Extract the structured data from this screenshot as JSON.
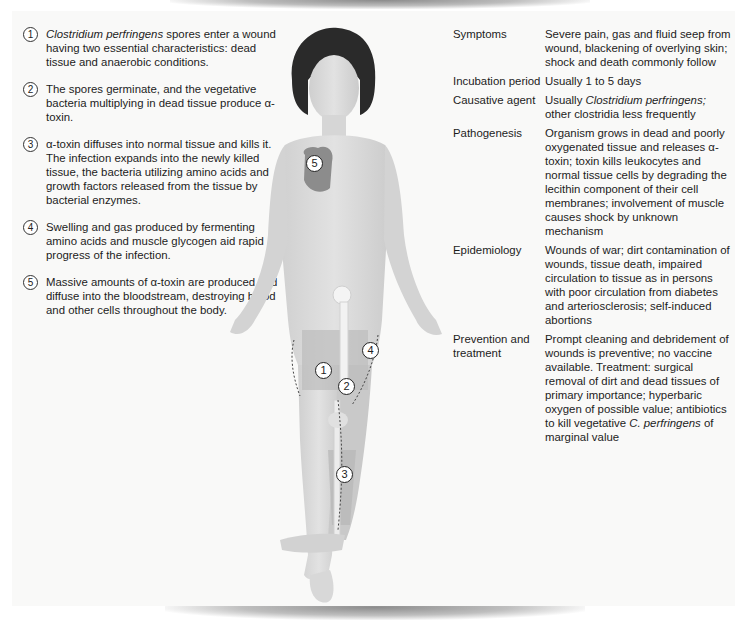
{
  "steps": [
    {
      "num": "1",
      "italic": "Clostridium perfringens",
      "text": " spores enter a wound having two essential characteristics: dead tissue and anaerobic conditions."
    },
    {
      "num": "2",
      "text": "The spores germinate, and the vegetative bacteria multiplying in dead tissue produce α-toxin."
    },
    {
      "num": "3",
      "text": "α-toxin diffuses into normal tissue and kills it. The infection expands into the newly killed tissue, the bacteria utilizing amino acids and growth factors released from the tissue by bacterial enzymes."
    },
    {
      "num": "4",
      "text": "Swelling and gas produced by fermenting amino acids and muscle glycogen aid rapid progress of the infection."
    },
    {
      "num": "5",
      "text": "Massive amounts of α-toxin are produced and diffuse into the bloodstream, destroying blood and other cells throughout the body."
    }
  ],
  "info": [
    {
      "key": "Symptoms",
      "value": "Severe pain, gas and fluid seep from wound, blackening of overlying skin; shock and death commonly follow"
    },
    {
      "key": "Incubation period",
      "value": "Usually 1 to 5 days"
    },
    {
      "key": "Causative agent",
      "value_pre": "Usually ",
      "value_italic": "Clostridium perfringens;",
      "value_post": " other clostridia less frequently"
    },
    {
      "key": "Pathogenesis",
      "value": "Organism grows in dead and poorly oxygenated tissue and releases α-toxin; toxin kills leukocytes and normal tissue cells by degrading the lecithin component of their cell membranes; involvement of muscle causes shock by unknown mechanism"
    },
    {
      "key": "Epidemiology",
      "value": "Wounds of war; dirt contamination of wounds, tissue death, impaired circulation to tissue as in persons with poor circulation from diabetes and arteriosclerosis; self-induced abortions"
    },
    {
      "key": "Prevention and treatment",
      "value_pre": "Prompt cleaning and debridement of wounds is preventive; no vaccine available. Treatment: surgical removal of dirt and dead tissues of primary importance; hyperbaric oxygen of possible value; antibiotics to kill vegetative ",
      "value_italic": "C. perfringens",
      "value_post": " of marginal value"
    }
  ],
  "figure": {
    "markers": [
      "1",
      "2",
      "3",
      "4",
      "5"
    ],
    "colors": {
      "skin": "#d9d9d9",
      "infected": "#bdbdbd",
      "hair": "#2a2a2a",
      "heart": "#8c8c8c"
    }
  }
}
